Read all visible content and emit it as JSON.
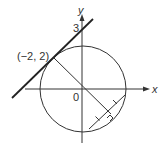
{
  "diagram": {
    "axes": {
      "x_label": "x",
      "y_label": "y",
      "origin_label": "0"
    },
    "tangent_point_label": "(−2, 2)",
    "y_intercept_label": "3",
    "elements": [
      "circle centered at origin",
      "tangent line through (-2, 2) with y-intercept 3",
      "radius from origin to (-2, 2) extended through origin",
      "chord perpendicular to the extended radius with equal-segment tick marks and right-angle marker"
    ],
    "colors": {
      "stroke": "#333333",
      "background": "#ffffff"
    }
  }
}
